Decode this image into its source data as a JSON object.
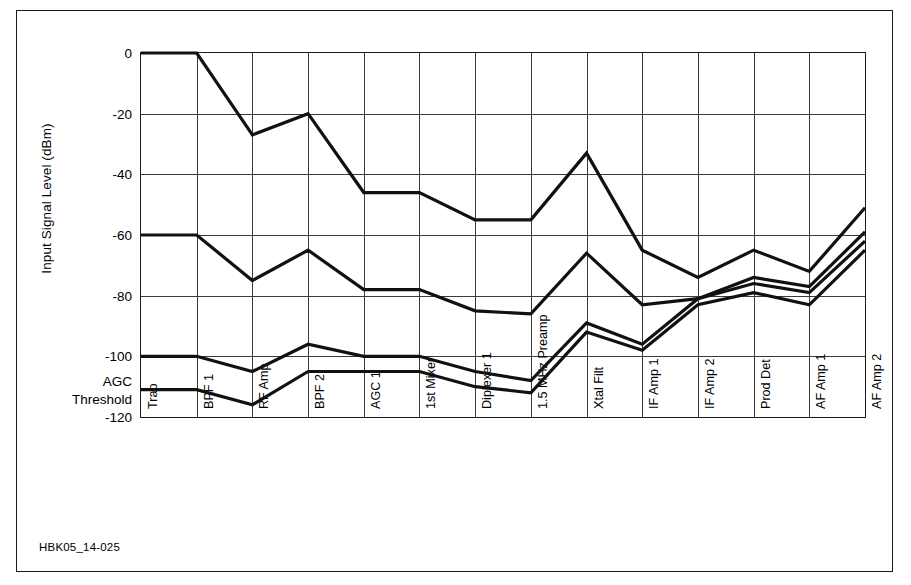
{
  "caption": "HBK05_14-025",
  "axis": {
    "ylabel": "Input Signal Level (dBm)",
    "yticks": [
      "0",
      "-20",
      "-40",
      "-60",
      "-80",
      "-100",
      "-120"
    ],
    "ytick_values": [
      0,
      -20,
      -40,
      -60,
      -80,
      -100,
      -120
    ],
    "agc_note_line1": "AGC",
    "agc_note_line2": "Threshold",
    "agc_threshold_value": -111
  },
  "chart_data": {
    "type": "line",
    "title": "",
    "xlabel": "",
    "ylabel": "Input Signal Level (dBm)",
    "ylim": [
      -120,
      0
    ],
    "grid": true,
    "legend": "none",
    "line_color": "#111111",
    "categories": [
      "Trap",
      "BPF 1",
      "RF Amp",
      "BPF 2",
      "AGC 1",
      "1st Mixer",
      "Diplexer 1",
      "1.5 MHz Preamp",
      "Xtal Filt",
      "IF Amp 1",
      "IF Amp 2",
      "Prod Det",
      "AF Amp 1",
      "AF Amp 2"
    ],
    "series": [
      {
        "name": "Signal 1",
        "values": [
          0,
          0,
          -27,
          -20,
          -46,
          -46,
          -55,
          -55,
          -33,
          -65,
          -74,
          -65,
          -72,
          -51
        ]
      },
      {
        "name": "Signal 2",
        "values": [
          -60,
          -60,
          -75,
          -65,
          -78,
          -78,
          -85,
          -86,
          -66,
          -83,
          -81,
          -74,
          -77,
          -59
        ]
      },
      {
        "name": "Signal 3",
        "values": [
          -100,
          -100,
          -105,
          -96,
          -100,
          -100,
          -105,
          -108,
          -89,
          -96,
          -81,
          -76,
          -79,
          -62
        ]
      },
      {
        "name": "AGC Threshold",
        "values": [
          -111,
          -111,
          -116,
          -105,
          -105,
          -105,
          -110,
          -112,
          -92,
          -98,
          -83,
          -79,
          -83,
          -65
        ]
      }
    ]
  }
}
